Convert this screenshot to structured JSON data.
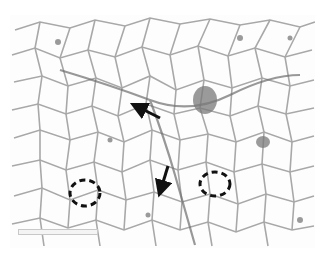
{
  "figure": {
    "colors": {
      "background": "#ffffff",
      "septa": "#8a8a8a",
      "annotation": "#111111"
    },
    "annotations": {
      "arrows": [
        {
          "from": [
            160,
            118
          ],
          "to": [
            135,
            106
          ],
          "label": ""
        },
        {
          "from": [
            168,
            166
          ],
          "to": [
            160,
            192
          ],
          "label": ""
        }
      ],
      "circles": [
        {
          "cx": 85,
          "cy": 193,
          "rx": 15,
          "ry": 13
        },
        {
          "cx": 215,
          "cy": 184,
          "rx": 15,
          "ry": 12
        }
      ]
    },
    "scale_bar": {
      "label": ""
    }
  }
}
